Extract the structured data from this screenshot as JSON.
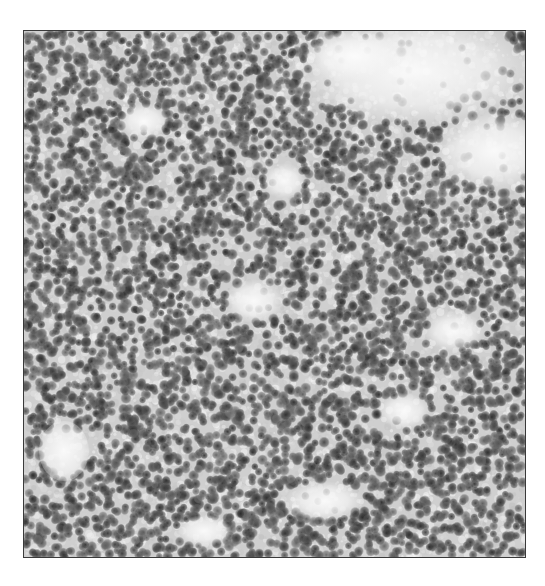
{
  "image": {
    "kind": "electron-micrograph",
    "description": "Grayscale micrograph of densely packed dark round particles with light voids",
    "alt_text": "Grayscale electron micrograph showing densely packed dark granular particles"
  },
  "colors": {
    "background": "#ffffff",
    "field": "#cfcfcf",
    "particle": "#3c3c3c",
    "void": "#fafafa",
    "frame": "#3a3a3a"
  }
}
